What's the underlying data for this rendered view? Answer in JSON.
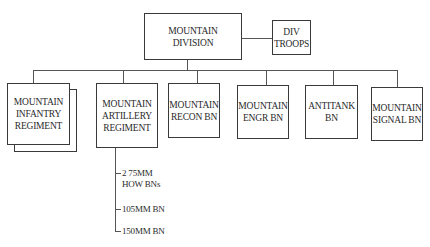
{
  "diagram": {
    "type": "org-chart",
    "root": {
      "label_line1": "MOUNTAIN",
      "label_line2": "DIVISION"
    },
    "attached": {
      "label_line1": "DIV",
      "label_line2": "TROOPS"
    },
    "units": [
      {
        "id": "infantry",
        "line1": "MOUNTAIN",
        "line2": "INFANTRY",
        "line3": "REGIMENT",
        "multiple": true
      },
      {
        "id": "artillery",
        "line1": "MOUNTAIN",
        "line2": "ARTILLERY",
        "line3": "REGIMENT"
      },
      {
        "id": "recon",
        "line1": "MOUNTAIN",
        "line2": "RECON BN"
      },
      {
        "id": "engr",
        "line1": "MOUNTAIN",
        "line2": "ENGR BN"
      },
      {
        "id": "antitank",
        "line1": "ANTITANK",
        "line2": "BN"
      },
      {
        "id": "signal",
        "line1": "MOUNTAIN",
        "line2": "SIGNAL BN"
      }
    ],
    "artillery_subunits": [
      {
        "line1": "2 75MM",
        "line2": "HOW BNs"
      },
      {
        "line1": "105MM BN"
      },
      {
        "line1": "150MM BN"
      }
    ]
  }
}
